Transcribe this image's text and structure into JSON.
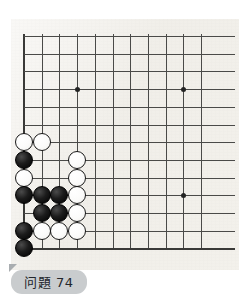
{
  "page": {
    "background_color": "#ffffff",
    "width": 239,
    "height": 300
  },
  "board": {
    "name": "go-board",
    "description_text": "",
    "background_color": "#f2f0eb",
    "line_color": "#4a4a48",
    "edge_line_color": "#3a3a38",
    "origin_x": 13,
    "origin_y": 17,
    "spacing": 17.7,
    "columns_visible": 11,
    "rows_visible": 13,
    "left_edge_col": 0,
    "bottom_edge_row": 12,
    "star_points": [
      {
        "col": 3,
        "row": 3
      },
      {
        "col": 9,
        "row": 3
      },
      {
        "col": 9,
        "row": 9
      }
    ],
    "stones": [
      {
        "color": "white",
        "col": 0,
        "row": 6
      },
      {
        "color": "white",
        "col": 1,
        "row": 6
      },
      {
        "color": "black",
        "col": 0,
        "row": 7
      },
      {
        "color": "white",
        "col": 3,
        "row": 7
      },
      {
        "color": "white",
        "col": 0,
        "row": 8
      },
      {
        "color": "white",
        "col": 3,
        "row": 8
      },
      {
        "color": "black",
        "col": 0,
        "row": 9
      },
      {
        "color": "black",
        "col": 1,
        "row": 9
      },
      {
        "color": "black",
        "col": 2,
        "row": 9
      },
      {
        "color": "white",
        "col": 3,
        "row": 9
      },
      {
        "color": "black",
        "col": 1,
        "row": 10
      },
      {
        "color": "black",
        "col": 2,
        "row": 10
      },
      {
        "color": "white",
        "col": 3,
        "row": 10
      },
      {
        "color": "black",
        "col": 0,
        "row": 11
      },
      {
        "color": "white",
        "col": 1,
        "row": 11
      },
      {
        "color": "white",
        "col": 2,
        "row": 11
      },
      {
        "color": "white",
        "col": 3,
        "row": 11
      },
      {
        "color": "black",
        "col": 0,
        "row": 12
      }
    ],
    "stone_colors": {
      "black": "#000000",
      "white": "#ffffff",
      "white_outline": "#1a1a1a"
    }
  },
  "label": {
    "text": "问題 74",
    "background_color": "#c9ccce",
    "text_color": "#23262b"
  }
}
